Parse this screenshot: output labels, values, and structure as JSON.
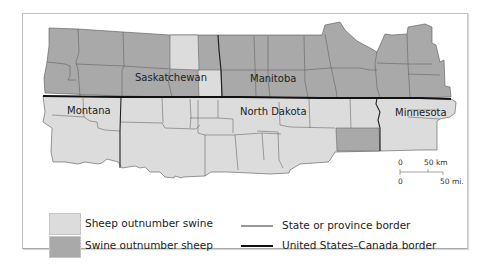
{
  "map": {
    "regions": [
      {
        "name": "Saskatchewan",
        "country": "Canada"
      },
      {
        "name": "Manitoba",
        "country": "Canada"
      },
      {
        "name": "Montana",
        "country": "United States"
      },
      {
        "name": "North Dakota",
        "country": "United States"
      },
      {
        "name": "Minnesota",
        "country": "United States"
      }
    ],
    "colors": {
      "sheep_outnumber_swine": "#dcdcdc",
      "swine_outnumber_sheep": "#a9a9a9",
      "state_border": "#333333",
      "national_border": "#111111"
    }
  },
  "labels": {
    "saskatchewan": "Saskatchewan",
    "manitoba": "Manitoba",
    "montana": "Montana",
    "north_dakota": "North Dakota",
    "minnesota": "Minnesota"
  },
  "scale": {
    "km_zero": "0",
    "km_label": "50 km",
    "mi_zero": "0",
    "mi_label": "50 mi."
  },
  "legend": {
    "items": [
      {
        "label": "Sheep outnumber swine",
        "type": "swatch",
        "color": "#dcdcdc"
      },
      {
        "label": "Swine outnumber sheep",
        "type": "swatch",
        "color": "#a9a9a9"
      },
      {
        "label": "State or province border",
        "type": "line"
      },
      {
        "label": "United States–Canada border",
        "type": "line"
      }
    ]
  }
}
